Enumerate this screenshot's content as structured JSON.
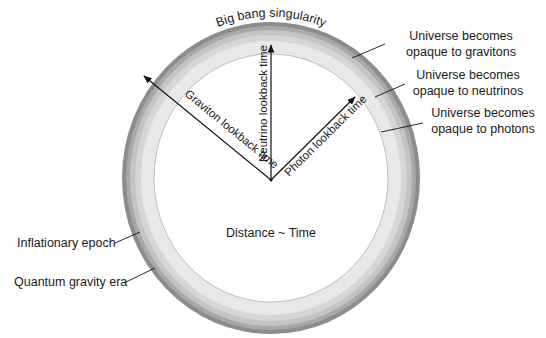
{
  "diagram": {
    "center_label": "Distance ~ Time",
    "top_label": "Big bang singularity",
    "right_labels": [
      {
        "line1": "Universe becomes",
        "line2": "opaque to gravitons"
      },
      {
        "line1": "Universe becomes",
        "line2": "opaque to neutrinos"
      },
      {
        "line1": "Universe becomes",
        "line2": "opaque to photons"
      }
    ],
    "left_labels": [
      {
        "text": "Inflationary epoch"
      },
      {
        "text": "Quantum gravity era"
      }
    ],
    "arrows": [
      {
        "label": "Graviton lookback time"
      },
      {
        "label": "Neutrino lookback time"
      },
      {
        "label": "Photon lookback time"
      }
    ],
    "ring_colors": {
      "quantum_gravity": "#8c8c8c",
      "inflation": "#a8a8a8",
      "graviton": "#c4c4c4",
      "neutrino": "#d6d6d6",
      "photon": "#e8e8e8",
      "interior": "#ffffff"
    }
  }
}
